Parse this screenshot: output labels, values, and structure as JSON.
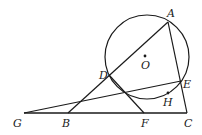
{
  "diagram": {
    "type": "geometry",
    "colors": {
      "stroke": "#1a1a1a",
      "background": "#ffffff"
    },
    "circle": {
      "name": "O",
      "cx": 147,
      "cy": 57,
      "r": 42
    },
    "points": {
      "A": {
        "label": "A",
        "x": 168,
        "y": 22
      },
      "B": {
        "label": "B",
        "x": 68,
        "y": 113
      },
      "C": {
        "label": "C",
        "x": 187,
        "y": 113
      },
      "D": {
        "label": "D",
        "x": 109,
        "y": 75
      },
      "E": {
        "label": "E",
        "x": 181,
        "y": 81
      },
      "F": {
        "label": "F",
        "x": 144,
        "y": 113
      },
      "G": {
        "label": "G",
        "x": 24,
        "y": 113
      },
      "H": {
        "label": "H",
        "x": 168,
        "y": 93
      },
      "O": {
        "label": "O",
        "x": 145,
        "y": 56
      }
    },
    "segments": [
      [
        "G",
        "C"
      ],
      [
        "B",
        "A"
      ],
      [
        "A",
        "C"
      ],
      [
        "G",
        "E"
      ],
      [
        "D",
        "F"
      ]
    ]
  }
}
